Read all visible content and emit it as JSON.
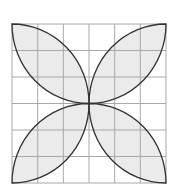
{
  "diagram": {
    "type": "geometric-figure",
    "grid": {
      "rows": 6,
      "cols": 6,
      "line_color": "#a8a8a8",
      "background": "#ffffff"
    },
    "shape": {
      "description": "Four leaf (lens) shapes formed by quarter-circle arcs meeting at center",
      "petal_count": 4,
      "fill_color": "#ebebeb",
      "stroke_color": "#333333"
    },
    "bounds": {
      "x": 12,
      "y": 24,
      "width": 154,
      "height": 159
    }
  }
}
